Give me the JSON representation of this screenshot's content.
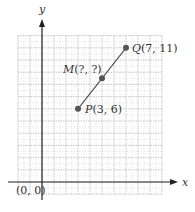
{
  "diagram": {
    "type": "coordinate-plane-midpoint",
    "axes": {
      "x_label": "x",
      "y_label": "y",
      "origin_label": "(0, 0)"
    },
    "grid": {
      "x_min": -2,
      "x_max": 10,
      "y_min": -1,
      "y_max": 12,
      "step": 1
    },
    "points": [
      {
        "id": "P",
        "name": "P",
        "coords": "(3, 6)",
        "x": 3,
        "y": 6
      },
      {
        "id": "M",
        "name": "M",
        "coords": "(?, ?)",
        "x": 5,
        "y": 8.5
      },
      {
        "id": "Q",
        "name": "Q",
        "coords": "(7, 11)",
        "x": 7,
        "y": 11
      }
    ],
    "segment": {
      "from": "P",
      "to": "Q"
    },
    "colors": {
      "axis": "#222222",
      "grid": "#b8b8b8",
      "segment": "#555555",
      "point": "#555555",
      "text": "#333333"
    }
  }
}
